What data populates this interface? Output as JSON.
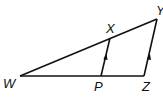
{
  "diagram": {
    "type": "geometry-triangle",
    "line_color": "#111111",
    "points": {
      "W": {
        "label": "W",
        "x": 20,
        "y": 76
      },
      "X": {
        "label": "X",
        "x": 110,
        "y": 38
      },
      "Y": {
        "label": "Y",
        "x": 157,
        "y": 19
      },
      "P": {
        "label": "P",
        "x": 101,
        "y": 76
      },
      "Z": {
        "label": "Z",
        "x": 144,
        "y": 76
      }
    },
    "segments": [
      {
        "from": "W",
        "to": "Y"
      },
      {
        "from": "W",
        "to": "Z"
      },
      {
        "from": "P",
        "to": "X",
        "parallel_mark": true
      },
      {
        "from": "Z",
        "to": "Y",
        "parallel_mark": true
      }
    ],
    "labels": {
      "W": "W",
      "X": "X",
      "Y": "Y",
      "P": "P",
      "Z": "Z"
    },
    "relationship": "PX ∥ ZY"
  }
}
